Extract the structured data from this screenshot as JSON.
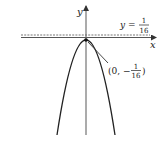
{
  "figure": {
    "axes": {
      "x_label": "x",
      "y_label": "y"
    },
    "directrix": {
      "label_prefix": "y =",
      "numerator": "1",
      "denominator": "16",
      "value": 0.0625,
      "style": "dashed"
    },
    "vertex": {
      "label_open": "(0, −",
      "numerator": "1",
      "denominator": "16",
      "label_close": ")",
      "x": 0,
      "y": -0.0625
    },
    "curve": {
      "type": "parabola",
      "opens": "down"
    },
    "colors": {
      "ink": "#222222",
      "axis": "#555555",
      "directrix": "#666666"
    }
  }
}
